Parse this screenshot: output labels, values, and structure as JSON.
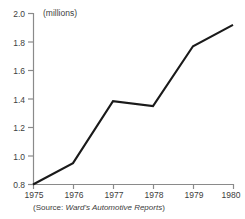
{
  "unit_label": "(millions)",
  "source": {
    "prefix": "(Source: ",
    "title": "Ward's Automotive Reports",
    "suffix": ")"
  },
  "axis": {
    "y_ticks": [
      "2.0",
      "1.8",
      "1.6",
      "1.4",
      "1.2",
      "1.0",
      "0.8"
    ],
    "x_ticks": [
      "1975",
      "1976",
      "1977",
      "1978",
      "1979",
      "1980"
    ]
  },
  "colors": {
    "line": "#1a1a1a",
    "axis": "#8a8a8a",
    "text": "#3d3d3d",
    "background": "#ffffff"
  },
  "chart_data": {
    "type": "line",
    "title": "",
    "subtitle": "",
    "xlabel": "",
    "ylabel": "(millions)",
    "unit": "millions",
    "x": [
      1975,
      1976,
      1977,
      1978,
      1979,
      1980
    ],
    "categories": [
      "1975",
      "1976",
      "1977",
      "1978",
      "1979",
      "1980"
    ],
    "values": [
      0.8,
      0.95,
      1.385,
      1.35,
      1.77,
      1.92
    ],
    "series": [
      {
        "name": "",
        "values": [
          0.8,
          0.95,
          1.385,
          1.35,
          1.77,
          1.92
        ]
      }
    ],
    "xlim": [
      1975,
      1980
    ],
    "ylim": [
      0.8,
      2.0
    ],
    "y_ticks": [
      0.8,
      1.0,
      1.2,
      1.4,
      1.6,
      1.8,
      2.0
    ],
    "x_ticks": [
      1975,
      1976,
      1977,
      1978,
      1979,
      1980
    ],
    "grid": false,
    "legend": false,
    "legend_position": "none",
    "annotations": [
      "(Source: Ward's Automotive Reports)"
    ]
  }
}
